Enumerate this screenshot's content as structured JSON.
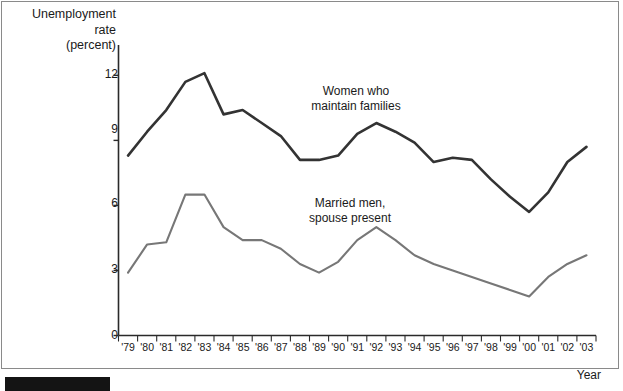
{
  "chart_data": {
    "type": "line",
    "title": "",
    "ylabel": "Unemployment\nrate\n(percent)",
    "xlabel": "Year",
    "ylim": [
      0,
      13.4
    ],
    "yticks": [
      0,
      3,
      6,
      9,
      12
    ],
    "ytick_labels": [
      "0",
      "3",
      "6",
      "9",
      "12"
    ],
    "grid": false,
    "legend_position": "inline-annotations",
    "categories": [
      "'79",
      "'80",
      "'81",
      "'82",
      "'83",
      "'84",
      "'85",
      "'86",
      "'87",
      "'88",
      "'89",
      "'90",
      "'91",
      "'92",
      "'93",
      "'94",
      "'95",
      "'96",
      "'97",
      "'98",
      "'99",
      "'00",
      "'01",
      "'02",
      "'03"
    ],
    "series": [
      {
        "name": "Women who maintain families",
        "color": "#333333",
        "values": [
          8.3,
          9.4,
          10.4,
          11.7,
          12.1,
          10.2,
          10.4,
          9.8,
          9.2,
          8.1,
          8.1,
          8.3,
          9.3,
          9.8,
          9.4,
          8.9,
          8.0,
          8.2,
          8.1,
          7.2,
          6.4,
          5.7,
          6.6,
          8.0,
          8.7
        ]
      },
      {
        "name": "Married men, spouse present",
        "color": "#777777",
        "values": [
          2.9,
          4.2,
          4.3,
          6.5,
          6.5,
          5.0,
          4.4,
          4.4,
          4.0,
          3.3,
          2.9,
          3.4,
          4.4,
          5.0,
          4.4,
          3.7,
          3.3,
          3.0,
          2.7,
          2.4,
          2.1,
          1.8,
          2.7,
          3.3,
          3.7
        ]
      }
    ],
    "annotations": [
      {
        "text": "Women who\nmaintain families",
        "x_left_px": 297,
        "y_top_px": 84
      },
      {
        "text": "Married men,\nspouse present",
        "x_left_px": 291,
        "y_top_px": 196
      }
    ]
  },
  "figure": {
    "y_axis_title": "Unemployment\nrate\n(percent)",
    "x_axis_title": "Year"
  }
}
